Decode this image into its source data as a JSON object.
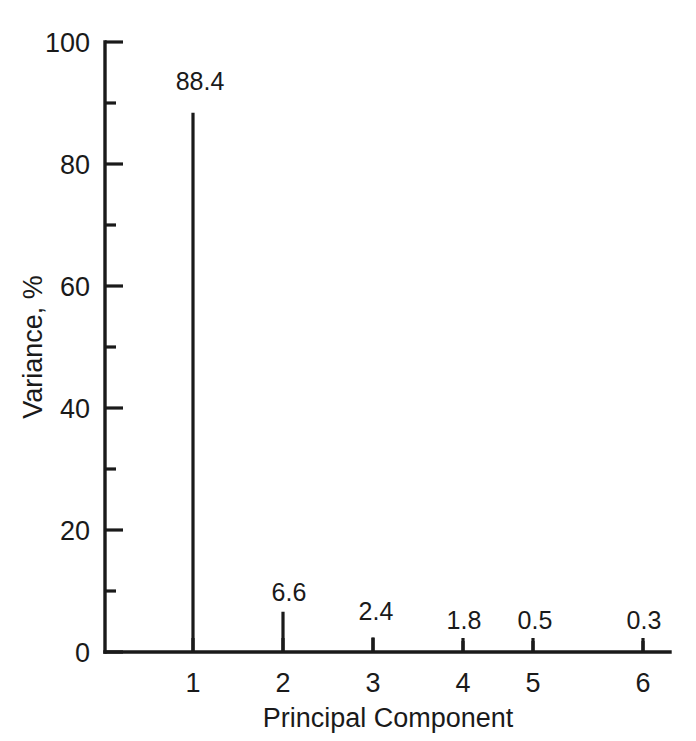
{
  "chart_data": {
    "type": "bar",
    "title": "",
    "subtitle": "",
    "xlabel": "Principal Component",
    "ylabel": "Variance, %",
    "categories": [
      "1",
      "2",
      "3",
      "4",
      "5",
      "6"
    ],
    "values": [
      88.4,
      6.6,
      2.4,
      1.8,
      0.5,
      0.3
    ],
    "point_labels": [
      "88.4",
      "6.6",
      "2.4",
      "1.8",
      "0.5",
      "0.3"
    ],
    "series": [
      {
        "name": "Variance, %",
        "values": [
          88.4,
          6.6,
          2.4,
          1.8,
          0.5,
          0.3
        ]
      }
    ],
    "xlim": [
      0.45,
      6.5
    ],
    "ylim": [
      0,
      100
    ],
    "y_ticks_major": [
      0,
      20,
      40,
      60,
      80,
      100
    ],
    "y_ticks_major_labels": [
      "0",
      "20",
      "40",
      "60",
      "80",
      "100"
    ],
    "y_ticks_minor": [
      10,
      30,
      50,
      70,
      90
    ],
    "x_ticks": [
      1,
      2,
      3,
      4,
      5,
      6
    ],
    "x_tick_labels": [
      "1",
      "2",
      "3",
      "4",
      "5",
      "6"
    ],
    "grid": false,
    "legend": false,
    "legend_position": "none",
    "annotations": [],
    "colors": {
      "background": "#ffffff",
      "ink": "#1a1a1a",
      "bar": "#1a1a1a",
      "axis": "#1a1a1a"
    }
  }
}
